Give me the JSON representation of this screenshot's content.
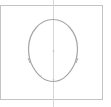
{
  "canvas": {
    "width": 111,
    "height": 107,
    "background": "#ffffff",
    "frame_color": "#bdbdbd",
    "stroke_color": "#a8a8a8",
    "guide_color": "#d0d0d0"
  },
  "drawing": {
    "subject": "head-outline",
    "frame": {
      "x": 0,
      "y": 5,
      "width": 103,
      "height": 95
    },
    "guide_line": {
      "x": 53,
      "y1": 0,
      "y2": 107
    },
    "head": {
      "top": [
        53,
        19
      ],
      "left_widest": [
        28,
        50
      ],
      "right_widest": [
        78,
        50
      ],
      "left_jaw": [
        29,
        61
      ],
      "right_jaw": [
        77,
        61
      ],
      "chin": [
        53,
        82
      ]
    },
    "markers": [
      {
        "x": 53,
        "y": 51
      },
      {
        "x": 53,
        "y": 80
      },
      {
        "x": 29,
        "y": 61
      },
      {
        "x": 77,
        "y": 61
      },
      {
        "x": 41,
        "y": 76
      }
    ]
  }
}
